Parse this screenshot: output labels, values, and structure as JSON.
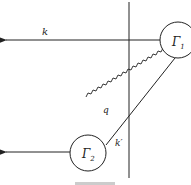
{
  "diagram": {
    "type": "feynman-like scattering diagram",
    "nodes": [
      {
        "id": "gamma1",
        "label": "Γ₁",
        "cx": 178,
        "cy": 40,
        "r": 18
      },
      {
        "id": "gamma2",
        "label": "Γ₂",
        "cx": 88,
        "cy": 153,
        "r": 18
      }
    ],
    "lines": {
      "k": {
        "label": "k",
        "from": "gamma1",
        "direction": "left-arrow",
        "y": 40
      },
      "bottom_outgoing": {
        "label": "",
        "from": "gamma2",
        "direction": "left-arrow",
        "y": 152
      },
      "q": {
        "label": "q",
        "style": "wavy",
        "from": "gamma1",
        "to": "gamma2"
      },
      "k_prime": {
        "label": "k′",
        "style": "straight",
        "from": "gamma1",
        "to": "gamma2"
      },
      "cut": {
        "label": "",
        "style": "vertical line",
        "x": 129
      }
    },
    "caption": "Fig."
  },
  "labels": {
    "k": "k",
    "q": "q",
    "k_prime": "k′",
    "gamma1": "Γ",
    "gamma1_sub": "1",
    "gamma2": "Γ",
    "gamma2_sub": "2"
  }
}
